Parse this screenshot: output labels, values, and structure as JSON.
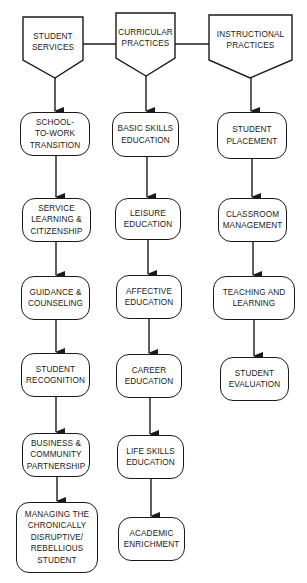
{
  "headers": [
    {
      "id": "student-services",
      "label": "STUDENT\nSERVICES"
    },
    {
      "id": "curricular-practices",
      "label": "CURRICULAR\nPRACTICES"
    },
    {
      "id": "instructional-practices",
      "label": "INSTRUCTIONAL\nPRACTICES"
    }
  ],
  "columns": {
    "student_services": [
      {
        "label": "SCHOOL-\nTO-WORK\nTRANSITION"
      },
      {
        "label": "SERVICE\nLEARNING &\nCITIZENSHIP"
      },
      {
        "label": "GUIDANCE &\nCOUNSELING"
      },
      {
        "label": "STUDENT\nRECOGNITION"
      },
      {
        "label": "BUSINESS &\nCOMMUNITY\nPARTNERSHIP"
      },
      {
        "label": "MANAGING THE\nCHRONICALLY\nDISRUPTIVE/\nREBELLIOUS\nSTUDENT"
      }
    ],
    "curricular_practices": [
      {
        "label": "BASIC SKILLS\nEDUCATION"
      },
      {
        "label": "LEISURE\nEDUCATION"
      },
      {
        "label": "AFFECTIVE\nEDUCATION"
      },
      {
        "label": "CAREER\nEDUCATION"
      },
      {
        "label": "LIFE SKILLS\nEDUCATION"
      },
      {
        "label": "ACADEMIC\nENRICHMENT"
      }
    ],
    "instructional_practices": [
      {
        "label": "STUDENT\nPLACEMENT"
      },
      {
        "label": "CLASSROOM\nMANAGEMENT"
      },
      {
        "label": "TEACHING AND\nLEARNING"
      },
      {
        "label": "STUDENT\nEVALUATION"
      }
    ]
  },
  "colors": {
    "stroke": "#1a1a1a",
    "background": "#ffffff"
  }
}
